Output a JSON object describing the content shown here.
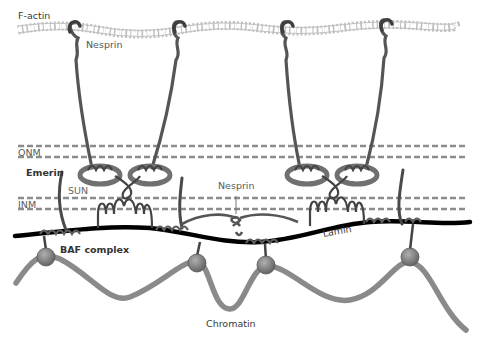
{
  "diagram": {
    "labels": {
      "factin": "F-actin",
      "nesprin_top": "Nesprin",
      "onm": "ONM",
      "emerin": "Emerin",
      "sun": "SUN",
      "inm": "INM",
      "nesprin_mid": "Nesprin",
      "lamin": "Lamin",
      "baf": "BAF complex",
      "chromatin": "Chromatin"
    },
    "colors": {
      "actin_bead": "#bdbdbd",
      "nesprin": "#555555",
      "membrane_dash": "#8c8c8c",
      "sun_ring": "#6e6e6e",
      "lamin": "#000000",
      "chromatin": "#8a8a8a",
      "baf_ball": "#7a7a7a"
    },
    "nodes": [
      {
        "id": "factin",
        "label": "F-actin",
        "kind": "filament"
      },
      {
        "id": "nesprin",
        "label": "Nesprin",
        "kind": "protein",
        "count": 4
      },
      {
        "id": "onm",
        "label": "ONM",
        "kind": "membrane"
      },
      {
        "id": "inm",
        "label": "INM",
        "kind": "membrane"
      },
      {
        "id": "sun",
        "label": "SUN",
        "kind": "protein"
      },
      {
        "id": "emerin",
        "label": "Emerin",
        "kind": "protein"
      },
      {
        "id": "lamin",
        "label": "Lamin",
        "kind": "filament"
      },
      {
        "id": "baf",
        "label": "BAF complex",
        "kind": "protein-complex",
        "count": 4
      },
      {
        "id": "chromatin",
        "label": "Chromatin",
        "kind": "fiber"
      }
    ],
    "edges": [
      {
        "from": "nesprin",
        "to": "factin",
        "relation": "binds"
      },
      {
        "from": "nesprin",
        "to": "sun",
        "relation": "binds (KASH-SUN)"
      },
      {
        "from": "sun",
        "to": "lamin",
        "relation": "binds"
      },
      {
        "from": "emerin",
        "to": "lamin",
        "relation": "binds"
      },
      {
        "from": "baf",
        "to": "lamin",
        "relation": "binds"
      },
      {
        "from": "baf",
        "to": "chromatin",
        "relation": "binds"
      }
    ]
  }
}
